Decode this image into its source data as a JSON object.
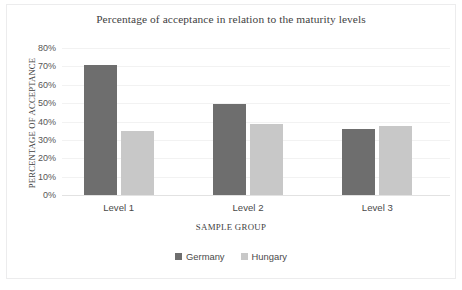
{
  "chart_data": {
    "type": "bar",
    "title": "Percentage of acceptance in relation to the maturity levels",
    "xlabel": "SAMPLE GROUP",
    "ylabel": "PERCENTAGE OF ACCEPTANCE",
    "categories": [
      "Level 1",
      "Level 2",
      "Level 3"
    ],
    "series": [
      {
        "name": "Germany",
        "color": "#6e6e6e",
        "values": [
          71,
          49.5,
          36
        ]
      },
      {
        "name": "Hungary",
        "color": "#c8c8c8",
        "values": [
          35,
          38.5,
          37.5
        ]
      }
    ],
    "ylim": [
      0,
      80
    ],
    "ytick_values": [
      80,
      70,
      60,
      50,
      40,
      30,
      20,
      10,
      0
    ],
    "ytick_labels": [
      "80%",
      "70%",
      "60%",
      "50%",
      "40%",
      "30%",
      "20%",
      "10%",
      "0%"
    ],
    "grid": true,
    "legend_position": "bottom"
  }
}
